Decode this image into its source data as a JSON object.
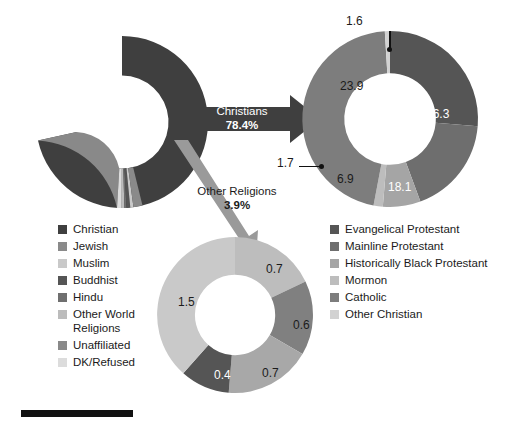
{
  "chart_data": [
    {
      "type": "pie",
      "id": "main-religious-composition",
      "title": "",
      "categories": [
        "Christian",
        "Jewish",
        "Muslim",
        "Buddhist",
        "Hindu",
        "Other World Religions",
        "Unaffiliated",
        "DK/Refused"
      ],
      "values": [
        78.4,
        1.7,
        0.6,
        0.7,
        0.4,
        0.5,
        16.1,
        0.8
      ],
      "colors": [
        "#3f3f3f",
        "#8a8a8a",
        "#c9c9c9",
        "#555555",
        "#6f6f6f",
        "#bcbcbc",
        "#898989",
        "#dcdcdc"
      ],
      "legend_position": "left-below",
      "annotations": [
        "Christians 78.4%",
        "Other Religions 3.9%"
      ]
    },
    {
      "type": "pie",
      "id": "christian-breakdown",
      "title": "",
      "categories": [
        "Evangelical Protestant",
        "Mainline Protestant",
        "Historically Black Protestant",
        "Mormon",
        "Catholic",
        "Other Christian"
      ],
      "values": [
        26.3,
        18.1,
        6.9,
        1.7,
        23.9,
        1.6
      ],
      "colors": [
        "#555555",
        "#6e6e6e",
        "#a5a5a5",
        "#bdbdbd",
        "#7d7d7d",
        "#d2d2d2"
      ],
      "labels": [
        "26.3",
        "18.1",
        "6.9",
        "1.7",
        "23.9",
        "1.6"
      ],
      "legend_position": "right-below"
    },
    {
      "type": "pie",
      "id": "other-religions-breakdown",
      "title": "",
      "categories": [
        "Jewish",
        "Muslim",
        "Buddhist",
        "Hindu",
        "Other World Religions"
      ],
      "values": [
        0.7,
        0.6,
        0.7,
        0.4,
        1.5
      ],
      "colors": [
        "#bdbdbd",
        "#808080",
        "#a8a8a8",
        "#555555",
        "#c9c9c9"
      ],
      "labels": [
        "0.7",
        "0.6",
        "0.7",
        "0.4",
        "1.5"
      ],
      "legend_position": "shared-left"
    }
  ],
  "main_chart": {
    "name": "main-donut",
    "callout_christians": {
      "line1": "Christians",
      "line2": "78.4%"
    },
    "callout_other": {
      "line1": "Other Religions",
      "line2": "3.9%"
    }
  },
  "legend_left": {
    "name": "main-legend",
    "items": [
      {
        "label": "Christian",
        "color": "#3f3f3f"
      },
      {
        "label": "Jewish",
        "color": "#8a8a8a"
      },
      {
        "label": "Muslim",
        "color": "#c9c9c9"
      },
      {
        "label": "Buddhist",
        "color": "#555555"
      },
      {
        "label": "Hindu",
        "color": "#6f6f6f"
      },
      {
        "label": "Other World\nReligions",
        "color": "#bcbcbc"
      },
      {
        "label": "Unaffiliated",
        "color": "#898989"
      },
      {
        "label": "DK/Refused",
        "color": "#dcdcdc"
      }
    ]
  },
  "legend_right": {
    "name": "christian-legend",
    "items": [
      {
        "label": "Evangelical Protestant",
        "color": "#555555"
      },
      {
        "label": "Mainline Protestant",
        "color": "#6e6e6e"
      },
      {
        "label": "Historically Black Protestant",
        "color": "#a5a5a5"
      },
      {
        "label": "Mormon",
        "color": "#bdbdbd"
      },
      {
        "label": "Catholic",
        "color": "#7d7d7d"
      },
      {
        "label": "Other Christian",
        "color": "#d2d2d2"
      }
    ]
  },
  "right_chart": {
    "name": "christian-donut",
    "labels": {
      "evangelical": "26.3",
      "mainline": "18.1",
      "historically_black": "6.9",
      "mormon": "1.7",
      "catholic": "23.9",
      "other_christian": "1.6"
    }
  },
  "bottom_chart": {
    "name": "other-religions-donut",
    "labels": {
      "jewish": "0.7",
      "muslim": "0.6",
      "buddhist": "0.7",
      "hindu": "0.4",
      "other_world": "1.5"
    }
  },
  "footer": {
    "rule": ""
  }
}
